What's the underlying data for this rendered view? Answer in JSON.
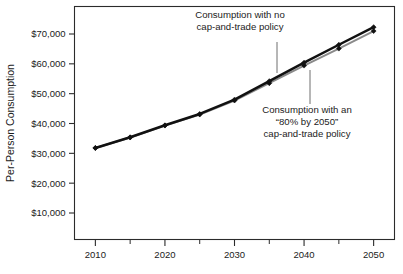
{
  "chart_data": {
    "type": "line",
    "title": "",
    "xlabel": "",
    "ylabel": "Per-Person Consumption",
    "x": [
      2010,
      2015,
      2020,
      2025,
      2030,
      2035,
      2040,
      2045,
      2050
    ],
    "xlim": [
      2007,
      2053
    ],
    "ylim": [
      0,
      77000
    ],
    "grid": false,
    "legend_position": "none",
    "x_tick_labels": [
      "2010",
      "2020",
      "2030",
      "2040",
      "2050"
    ],
    "x_major_ticks": [
      2010,
      2020,
      2030,
      2040,
      2050
    ],
    "x_minor_ticks": [
      2015,
      2025,
      2035,
      2045
    ],
    "y_tick_labels": [
      "$10,000",
      "$20,000",
      "$30,000",
      "$40,000",
      "$50,000",
      "$60,000",
      "$70,000"
    ],
    "y_ticks": [
      10000,
      20000,
      30000,
      40000,
      50000,
      60000,
      70000
    ],
    "series": [
      {
        "name": "Consumption with no cap-and-trade policy",
        "color": "#111111",
        "values": [
          31800,
          35400,
          39400,
          43200,
          48000,
          54200,
          60400,
          66400,
          72300
        ]
      },
      {
        "name": "Consumption with an “80% by 2050” cap-and-trade policy",
        "color": "#8a8a8a",
        "values": [
          31800,
          35300,
          39300,
          43000,
          47700,
          53500,
          59400,
          65100,
          71000
        ]
      }
    ],
    "annotations": [
      {
        "id": "annotation-no-policy",
        "lines": [
          "Consumption with no",
          "cap-and-trade policy"
        ],
        "text_anchor_x": 240,
        "text_anchor_y": 18,
        "leader_x": 277,
        "leader_y1": 42,
        "leader_y2": 73
      },
      {
        "id": "annotation-policy",
        "lines": [
          "Consumption with an",
          "“80% by 2050”",
          "cap-and-trade policy"
        ],
        "text_anchor_x": 307,
        "text_anchor_y": 113,
        "leader_x": 310,
        "leader_y1": 70,
        "leader_y2": 104
      }
    ]
  },
  "colors": {
    "frame": "#2b2b2b",
    "series_no_policy": "#111111",
    "series_policy": "#8a8a8a",
    "text": "#1b1b1b",
    "background": "#ffffff"
  },
  "axes": {
    "y_title": "Per-Person Consumption"
  }
}
